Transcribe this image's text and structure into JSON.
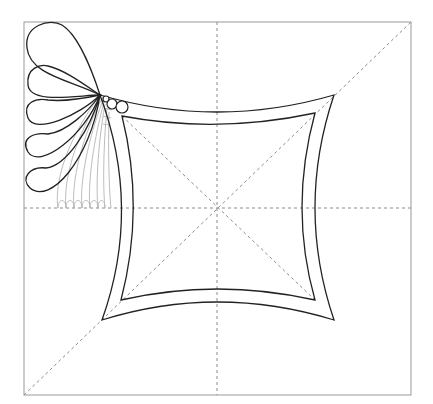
{
  "diagram": {
    "colors": {
      "background": "#ffffff",
      "ink": "#222222",
      "guide": "#8c8c8c",
      "echo": "#b4b4b4",
      "frame": "#9a9a9a"
    },
    "frame": {
      "x": 24,
      "y": 22,
      "width": 387,
      "height": 373
    },
    "center": {
      "x": 217,
      "y": 208
    },
    "outer_curved_square": {
      "corners": {
        "tl": [
          100,
          95
        ],
        "tr": [
          334,
          95
        ],
        "br": [
          334,
          320
        ],
        "bl": [
          102,
          320
        ]
      },
      "mid_edges": {
        "top": 112,
        "bottom": 302,
        "left": 121,
        "right": 315
      }
    },
    "inner_curved_square": {
      "corners": {
        "tl": [
          122,
          116
        ],
        "tr": [
          315,
          113
        ],
        "br": [
          315,
          300
        ],
        "bl": [
          121,
          300
        ]
      },
      "mid_edges": {
        "top": 125,
        "bottom": 289,
        "left": 133,
        "right": 302
      }
    },
    "fan_apex": [
      100,
      95
    ],
    "circles": [
      {
        "cx": 106,
        "cy": 99,
        "r": 3
      },
      {
        "cx": 112,
        "cy": 104,
        "r": 5
      },
      {
        "cx": 122,
        "cy": 107,
        "r": 6
      }
    ],
    "petal_count": 5,
    "echo_line_count": 8
  }
}
